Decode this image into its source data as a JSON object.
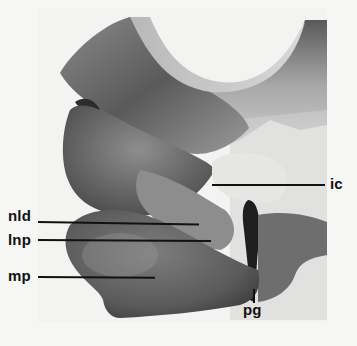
{
  "figure": {
    "labels": {
      "ic": "ic",
      "nld": "nld",
      "lnp": "lnp",
      "mp": "mp",
      "pg": "pg"
    },
    "colors": {
      "background": "#f6f6f4",
      "label_text": "#111111",
      "leader_line": "#111111",
      "tissue_dark": "#3a3a3a",
      "tissue_mid": "#7a7a7a",
      "tissue_light": "#bdbdbd"
    }
  }
}
